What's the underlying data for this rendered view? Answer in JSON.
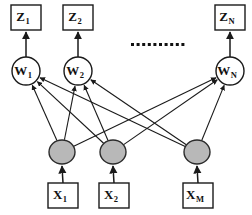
{
  "diagram": {
    "colors": {
      "hidden_node_fill": "#b8b8b8",
      "stroke": "#1a1a1a",
      "background": "#ffffff"
    },
    "ellipsis": {
      "label": "..........",
      "dot_count": 10,
      "x_start": 131,
      "y": 43,
      "spacing": 5.6,
      "size": 3
    },
    "output_layer": {
      "name": "Z",
      "nodes": [
        {
          "base": "Z",
          "sub": "1",
          "box_x": 11,
          "box_y": 5,
          "box_w": 30,
          "box_h": 25
        },
        {
          "base": "Z",
          "sub": "2",
          "box_x": 63,
          "box_y": 5,
          "box_w": 30,
          "box_h": 25
        },
        {
          "base": "Z",
          "sub": "N",
          "box_x": 215,
          "box_y": 5,
          "box_w": 30,
          "box_h": 25
        }
      ]
    },
    "weight_layer": {
      "name": "W",
      "nodes": [
        {
          "base": "W",
          "sub": "1",
          "cx": 26,
          "cy": 71,
          "r": 14
        },
        {
          "base": "W",
          "sub": "2",
          "cx": 78,
          "cy": 71,
          "r": 14
        },
        {
          "base": "W",
          "sub": "N",
          "cx": 230,
          "cy": 71,
          "r": 14
        }
      ]
    },
    "hidden_layer": {
      "name": "hidden",
      "nodes": [
        {
          "cx": 62,
          "cy": 152,
          "rx": 13,
          "ry": 12
        },
        {
          "cx": 113,
          "cy": 152,
          "rx": 13,
          "ry": 12
        },
        {
          "cx": 197,
          "cy": 152,
          "rx": 13,
          "ry": 12
        }
      ]
    },
    "input_layer": {
      "name": "X",
      "nodes": [
        {
          "base": "X",
          "sub": "1",
          "box_x": 48,
          "box_y": 183,
          "box_w": 30,
          "box_h": 25
        },
        {
          "base": "X",
          "sub": "2",
          "box_x": 99,
          "box_y": 183,
          "box_w": 30,
          "box_h": 25
        },
        {
          "base": "X",
          "sub": "M",
          "box_x": 183,
          "box_y": 183,
          "box_w": 30,
          "box_h": 25
        }
      ]
    },
    "connections": {
      "input_to_hidden": [
        {
          "from": 0,
          "to": 0
        },
        {
          "from": 1,
          "to": 1
        },
        {
          "from": 2,
          "to": 2
        }
      ],
      "hidden_to_weight": [
        {
          "from": 0,
          "to": 0
        },
        {
          "from": 0,
          "to": 1
        },
        {
          "from": 0,
          "to": 2
        },
        {
          "from": 1,
          "to": 0
        },
        {
          "from": 1,
          "to": 1
        },
        {
          "from": 1,
          "to": 2
        },
        {
          "from": 2,
          "to": 0
        },
        {
          "from": 2,
          "to": 1
        },
        {
          "from": 2,
          "to": 2
        }
      ],
      "weight_to_output": [
        {
          "from": 0,
          "to": 0
        },
        {
          "from": 1,
          "to": 1
        },
        {
          "from": 2,
          "to": 2
        }
      ]
    }
  }
}
